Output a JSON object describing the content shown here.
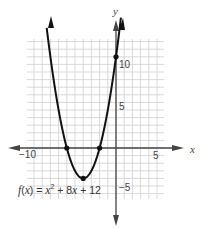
{
  "chart_data": {
    "type": "line",
    "title": "",
    "function_label": "f(x) = x² + 8x + 12",
    "function_parts": {
      "f": "f",
      "x1": "x",
      "x2": "x",
      "rest_a": "(",
      "rest_b": ") = ",
      "plus8": " + 8",
      "plus12": " + 12",
      "sup": "2"
    },
    "xlabel": "x",
    "ylabel": "y",
    "xlim": [
      -11,
      6
    ],
    "ylim": [
      -7,
      14
    ],
    "x_ticks_labeled": [
      {
        "value": -10,
        "label": "−10"
      },
      {
        "value": 5,
        "label": "5"
      }
    ],
    "y_ticks_labeled": [
      {
        "value": 10,
        "label": "10"
      },
      {
        "value": 5,
        "label": "5"
      },
      {
        "value": -5,
        "label": "−5"
      }
    ],
    "grid": true,
    "series": [
      {
        "name": "f(x) = x^2 + 8x + 12",
        "x": [
          -8.6,
          -8,
          -7,
          -6,
          -5,
          -4,
          -3,
          -2,
          -1,
          0,
          0.7
        ],
        "y": [
          17.2,
          12,
          5,
          0,
          -3,
          -4,
          -3,
          0,
          5,
          12,
          18.1
        ]
      }
    ],
    "marked_points": [
      {
        "x": -6,
        "y": 0,
        "label": "root"
      },
      {
        "x": -2,
        "y": 0,
        "label": "root"
      },
      {
        "x": -4,
        "y": -4,
        "label": "vertex"
      },
      {
        "x": 0,
        "y": 12,
        "label": "y-intercept"
      }
    ]
  },
  "colors": {
    "curve": "#111111",
    "axis": "#444444",
    "grid": "#cfcfcf",
    "text": "#444444"
  }
}
